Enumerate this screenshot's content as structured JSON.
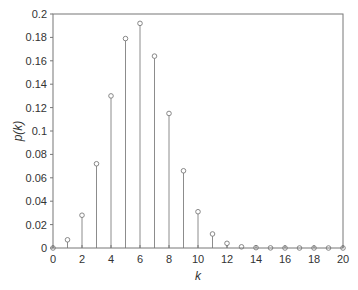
{
  "chart_data": {
    "type": "stem",
    "title": "",
    "xlabel": "k",
    "ylabel": "p(k)",
    "xlim": [
      0,
      20
    ],
    "ylim": [
      0,
      0.2
    ],
    "grid": false,
    "legend": null,
    "x_ticks": [
      0,
      2,
      4,
      6,
      8,
      10,
      12,
      14,
      16,
      18,
      20
    ],
    "x_tick_labels": [
      "0",
      "2",
      "4",
      "6",
      "8",
      "10",
      "12",
      "14",
      "16",
      "18",
      "20"
    ],
    "y_ticks": [
      0,
      0.02,
      0.04,
      0.06,
      0.08,
      0.1,
      0.12,
      0.14,
      0.16,
      0.18,
      0.2
    ],
    "y_tick_labels": [
      "0",
      "0.02",
      "0.04",
      "0.06",
      "0.08",
      "0.1",
      "0.12",
      "0.14",
      "0.16",
      "0.18",
      "0.2"
    ],
    "x": [
      0,
      1,
      2,
      3,
      4,
      5,
      6,
      7,
      8,
      9,
      10,
      11,
      12,
      13,
      14,
      15,
      16,
      17,
      18,
      19,
      20
    ],
    "values": [
      0.0,
      0.007,
      0.028,
      0.072,
      0.13,
      0.179,
      0.192,
      0.164,
      0.115,
      0.066,
      0.031,
      0.012,
      0.004,
      0.001,
      0.0003,
      0.0001,
      0.0,
      0.0,
      0.0,
      0.0,
      0.0
    ]
  },
  "style": {
    "stem_color": "#8c8c8c",
    "marker_color": "#7a7a7a",
    "axis_color": "#777777"
  }
}
